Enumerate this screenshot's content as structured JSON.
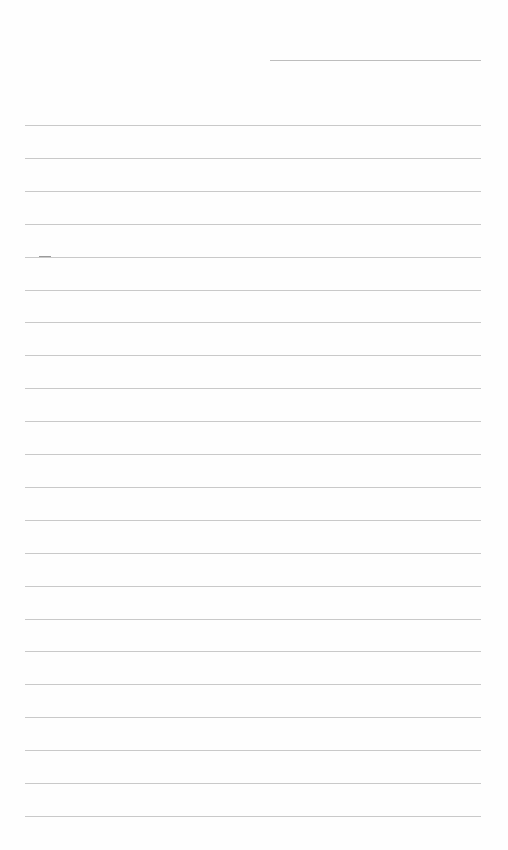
{
  "page": {
    "type": "lined-writing-sheet",
    "background": "#fefefe",
    "rule_color": "#c9c9c9",
    "header_line": {
      "x": 270,
      "y": 60,
      "width": 211
    },
    "lines": {
      "count": 22,
      "x": 25,
      "width": 456,
      "first_y": 125,
      "spacing": 32.9
    }
  }
}
